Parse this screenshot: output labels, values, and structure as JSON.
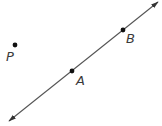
{
  "diagram": {
    "type": "geometry",
    "line": {
      "name": "line-AB",
      "start": [
        9,
        121
      ],
      "end": [
        158,
        2
      ],
      "stroke": "#555555",
      "arrowheads": "both"
    },
    "points": [
      {
        "id": "P",
        "label": "P",
        "x": 15,
        "y": 45,
        "label_x": 6,
        "label_y": 50
      },
      {
        "id": "A",
        "label": "A",
        "x": 72,
        "y": 71,
        "label_x": 76,
        "label_y": 74
      },
      {
        "id": "B",
        "label": "B",
        "x": 123,
        "y": 30,
        "label_x": 126,
        "label_y": 32
      }
    ],
    "colors": {
      "point": "#111111",
      "line": "#555555",
      "label": "#3a3a3a"
    }
  }
}
